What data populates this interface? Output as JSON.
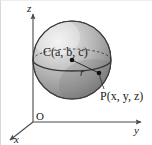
{
  "figure": {
    "background_color": "#ffffff",
    "width": 152,
    "height": 145
  },
  "axes": {
    "z_label": "z",
    "y_label": "y",
    "x_label": "x",
    "origin_label": "O",
    "axis_color": "#4a4a4a"
  },
  "sphere": {
    "center_label": "C(a, b, c)",
    "center_name": "C",
    "center_coordinates": "(a, b, c)",
    "radius_label": "r",
    "point_label": "P(x, y, z)",
    "point_name": "P",
    "point_coordinates": "(x, y, z)",
    "fill_light": "#e8e8e8",
    "fill_mid": "#b9b9b9",
    "fill_dark": "#848484",
    "outline_color": "#3d3d3d"
  },
  "equator": {
    "front_style": "solid",
    "back_style": "dashed"
  }
}
